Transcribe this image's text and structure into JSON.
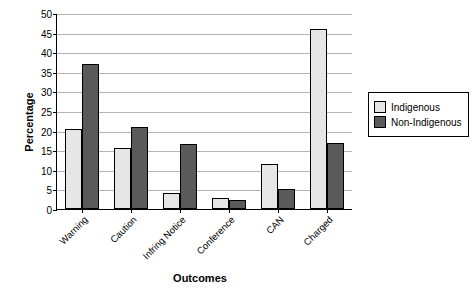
{
  "chart_data": {
    "type": "bar",
    "title": "",
    "xlabel": "Outcomes",
    "ylabel": "Percentage",
    "categories": [
      "Warning",
      "Caution",
      "Infring Notice",
      "Conference",
      "CAN",
      "Charged"
    ],
    "series": [
      {
        "name": "Indigenous",
        "values": [
          20.5,
          15.5,
          4.0,
          2.7,
          11.5,
          45.8
        ]
      },
      {
        "name": "Non-Indigenous",
        "values": [
          37.0,
          20.8,
          16.5,
          2.2,
          5.2,
          16.8
        ]
      }
    ],
    "ylim": [
      0,
      50
    ],
    "yticks": [
      0,
      5,
      10,
      15,
      20,
      25,
      30,
      35,
      40,
      45,
      50
    ],
    "ytick_labels": [
      "0",
      "5",
      "10",
      "15",
      "20",
      "25",
      "30",
      "35",
      "40",
      "45",
      "50"
    ],
    "grid": true,
    "legend_position": "right",
    "colors": {
      "indigenous": "#e6e6e6",
      "non_indigenous": "#5a5a5a",
      "axis": "#000000",
      "gridline": "#b5b5b5"
    }
  }
}
